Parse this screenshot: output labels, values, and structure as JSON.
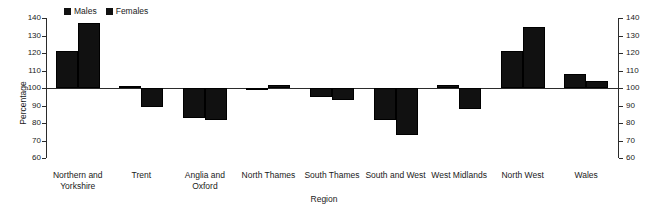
{
  "chart_data": {
    "type": "bar",
    "title": "",
    "xlabel": "Region",
    "ylabel": "Percentage",
    "ylim": [
      60,
      140
    ],
    "ytick_step": 10,
    "yticks": [
      60,
      70,
      80,
      90,
      100,
      110,
      120,
      130,
      140
    ],
    "grid": false,
    "baseline": 100,
    "dual_axis": true,
    "legend_position": "top-left",
    "bar_color": "#111111",
    "axis_color": "#2b2b2b",
    "text_color": "#1a1a1a",
    "categories": [
      "Northern and Yorkshire",
      "Trent",
      "Anglia and Oxford",
      "North Thames",
      "South Thames",
      "South and West",
      "West Midlands",
      "North West",
      "Wales"
    ],
    "category_label_lines": [
      [
        "Northern and",
        "Yorkshire"
      ],
      [
        "Trent"
      ],
      [
        "Anglia and Oxford"
      ],
      [
        "North Thames"
      ],
      [
        "South Thames"
      ],
      [
        "South and West"
      ],
      [
        "West Midlands"
      ],
      [
        "North West"
      ],
      [
        "Wales"
      ]
    ],
    "series": [
      {
        "name": "Males",
        "values": [
          121,
          101,
          83,
          99,
          95,
          82,
          102,
          121,
          108
        ]
      },
      {
        "name": "Females",
        "values": [
          137,
          89,
          82,
          102,
          93,
          73,
          88,
          135,
          104
        ]
      }
    ]
  },
  "legend": {
    "entries": [
      {
        "label": "Males"
      },
      {
        "label": "Females"
      }
    ]
  },
  "axes": {
    "y_title": "Percentage",
    "x_title": "Region",
    "y_tick_labels": [
      "140",
      "130",
      "120",
      "110",
      "100",
      "90",
      "80",
      "70",
      "60"
    ]
  },
  "icons": {
    "legend_marker": "filled-square-icon"
  }
}
